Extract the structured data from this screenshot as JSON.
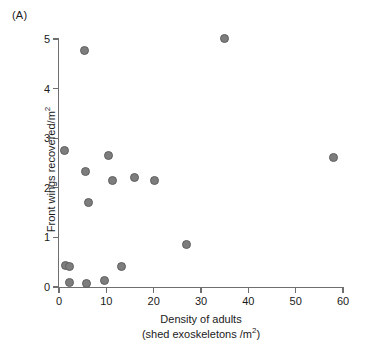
{
  "figure": {
    "panel_label": "(A)",
    "point_color": "#7d7d7d",
    "point_edge_color": "#5f5f5f",
    "axis_color": "#6f6f6f"
  },
  "axes": {
    "x_title_line1": "Density of adults",
    "x_title_line2_prefix": "(shed exoskeletons /m",
    "x_title_line2_sup": "2",
    "x_title_line2_suffix": ")",
    "y_title_prefix": "Front wings recovered/m",
    "y_title_sup": "2",
    "x_ticks": [
      "0",
      "10",
      "20",
      "30",
      "40",
      "50",
      "60"
    ],
    "y_ticks": [
      "0",
      "1",
      "2",
      "3",
      "4",
      "5"
    ]
  },
  "chart_data": {
    "type": "scatter",
    "title": "(A)",
    "xlabel": "Density of adults (shed exoskeletons /m2)",
    "ylabel": "Front wings recovered/m2",
    "xlim": [
      0,
      60
    ],
    "ylim": [
      0,
      5.2
    ],
    "xticks": [
      0,
      10,
      20,
      30,
      40,
      50,
      60
    ],
    "yticks": [
      0,
      1,
      2,
      3,
      4,
      5
    ],
    "grid": false,
    "legend": null,
    "marker": "filled-circle",
    "marker_color": "#7d7d7d",
    "points": [
      {
        "x": 1.2,
        "y": 2.75
      },
      {
        "x": 1.4,
        "y": 0.44
      },
      {
        "x": 2.2,
        "y": 0.42
      },
      {
        "x": 2.3,
        "y": 0.09
      },
      {
        "x": 5.4,
        "y": 4.77
      },
      {
        "x": 5.6,
        "y": 2.33
      },
      {
        "x": 5.9,
        "y": 0.07
      },
      {
        "x": 6.3,
        "y": 1.71
      },
      {
        "x": 9.6,
        "y": 0.13
      },
      {
        "x": 10.4,
        "y": 2.65
      },
      {
        "x": 11.2,
        "y": 2.14
      },
      {
        "x": 13.2,
        "y": 0.42
      },
      {
        "x": 16.0,
        "y": 2.2
      },
      {
        "x": 20.2,
        "y": 2.14
      },
      {
        "x": 27.0,
        "y": 0.86
      },
      {
        "x": 35.0,
        "y": 5.02
      },
      {
        "x": 58.0,
        "y": 2.62
      }
    ]
  }
}
